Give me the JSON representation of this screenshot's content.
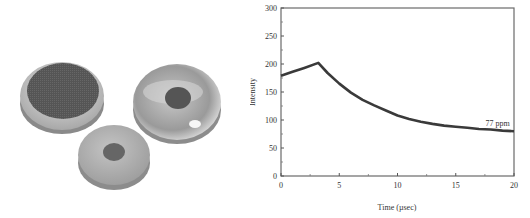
{
  "photo": {
    "description": "Three round sensor discs with dark centers",
    "discs": [
      {
        "name": "large-dark-disc",
        "cx": 62,
        "cy": 95,
        "rx": 42,
        "ry": 34
      },
      {
        "name": "transparent-dome-disc",
        "cx": 177,
        "cy": 100,
        "rx": 44,
        "ry": 40
      },
      {
        "name": "small-spot-disc",
        "cx": 114,
        "cy": 155,
        "rx": 36,
        "ry": 30
      }
    ]
  },
  "chart_data": {
    "type": "line",
    "title": "",
    "xlabel": "Time (µsec)",
    "ylabel": "Intensity",
    "xlim": [
      0,
      20
    ],
    "ylim": [
      0,
      300
    ],
    "xticks": [
      "0",
      "5",
      "10",
      "15",
      "20"
    ],
    "yticks": [
      "0",
      "50",
      "100",
      "150",
      "200",
      "250",
      "300"
    ],
    "grid": false,
    "annotations": [
      {
        "text": "77 ppm",
        "x": 18.6,
        "y": 90
      }
    ],
    "series": [
      {
        "name": "77 ppm",
        "x": [
          0,
          1,
          2,
          3.2,
          4,
          5,
          6,
          7,
          8,
          9,
          10,
          11,
          12,
          13,
          14,
          15,
          16,
          17,
          18,
          19,
          20
        ],
        "y": [
          179,
          186,
          193,
          202,
          184,
          165,
          149,
          136,
          126,
          117,
          108,
          102,
          97,
          93,
          90,
          88,
          86,
          84,
          83,
          81,
          80
        ]
      }
    ]
  }
}
